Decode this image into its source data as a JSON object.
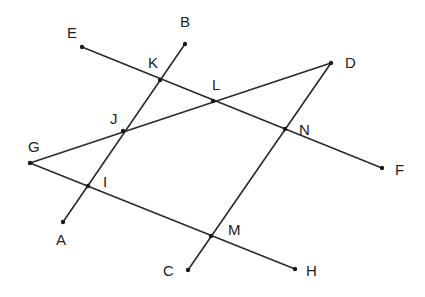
{
  "diagram": {
    "type": "geometry-lines-and-intersections",
    "points": {
      "A": {
        "x": 63,
        "y": 222,
        "label": "A",
        "lx": 56,
        "ly": 245
      },
      "B": {
        "x": 185,
        "y": 44,
        "label": "B",
        "lx": 180,
        "ly": 27
      },
      "C": {
        "x": 188,
        "y": 270,
        "label": "C",
        "lx": 163,
        "ly": 276
      },
      "D": {
        "x": 331,
        "y": 63,
        "label": "D",
        "lx": 345,
        "ly": 68
      },
      "E": {
        "x": 82,
        "y": 47,
        "label": "E",
        "lx": 67,
        "ly": 38
      },
      "F": {
        "x": 382,
        "y": 168,
        "label": "F",
        "lx": 395,
        "ly": 175
      },
      "G": {
        "x": 30,
        "y": 163,
        "label": "G",
        "lx": 28,
        "ly": 152
      },
      "H": {
        "x": 295,
        "y": 269,
        "label": "H",
        "lx": 306,
        "ly": 276
      },
      "I": {
        "x": 88,
        "y": 186,
        "label": "I",
        "lx": 103,
        "ly": 187
      },
      "J": {
        "x": 123,
        "y": 131,
        "label": "J",
        "lx": 110,
        "ly": 124
      },
      "K": {
        "x": 160,
        "y": 80,
        "label": "K",
        "lx": 148,
        "ly": 68
      },
      "L": {
        "x": 213,
        "y": 101,
        "label": "L",
        "lx": 212,
        "ly": 90
      },
      "M": {
        "x": 211,
        "y": 236,
        "label": "M",
        "lx": 228,
        "ly": 235
      },
      "N": {
        "x": 285,
        "y": 129,
        "label": "N",
        "lx": 299,
        "ly": 135
      }
    },
    "segments": [
      {
        "name": "AB",
        "from": "A",
        "to": "B"
      },
      {
        "name": "CD",
        "from": "C",
        "to": "D"
      },
      {
        "name": "EF",
        "from": "E",
        "to": "F"
      },
      {
        "name": "GH",
        "from": "G",
        "to": "H"
      },
      {
        "name": "GD",
        "from": "G",
        "to": "D"
      }
    ],
    "dots": [
      "A",
      "B",
      "C",
      "D",
      "E",
      "F",
      "G",
      "H",
      "I",
      "J",
      "K",
      "L",
      "M",
      "N"
    ],
    "colors": {
      "line": "#2a2a2a",
      "point": "#1a1a1a",
      "label": "#222222",
      "background": "#ffffff"
    }
  }
}
